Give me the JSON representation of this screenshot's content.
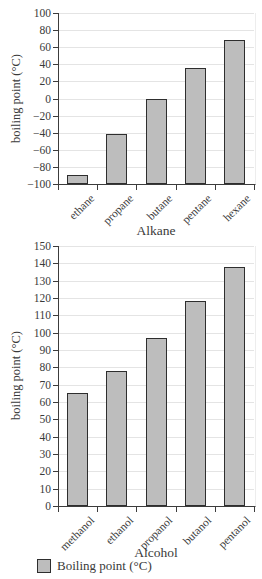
{
  "page": {
    "background": "#ffffff"
  },
  "colors": {
    "bar_fill": "#bdbdbd",
    "bar_border": "#2e2e2e",
    "gridline": "#e4e4e4",
    "axis": "#3c3c3c",
    "text": "#3a3a3a"
  },
  "legend": {
    "label": "Boiling point (°C)",
    "swatch_color": "#bdbdbd"
  },
  "chart_data": [
    {
      "type": "bar",
      "title": "",
      "xlabel": "Alkane",
      "ylabel": "boiling point (°C)",
      "categories": [
        "ethane",
        "propane",
        "butane",
        "pentane",
        "hexane"
      ],
      "values": [
        -89,
        -42,
        -1,
        36,
        69
      ],
      "ylim": [
        -100,
        100
      ],
      "ytick_step": 20,
      "grid": true,
      "legend_position": "none",
      "bar_baseline": "axis-minimum"
    },
    {
      "type": "bar",
      "title": "",
      "xlabel": "Alcohol",
      "ylabel": "boiling point (°C)",
      "categories": [
        "methanol",
        "ethanol",
        "propanol",
        "butanol",
        "pentanol"
      ],
      "values": [
        65,
        78,
        97,
        118,
        138
      ],
      "ylim": [
        0,
        150
      ],
      "ytick_step": 10,
      "grid": true,
      "legend_position": "bottom",
      "bar_baseline": "axis-minimum"
    }
  ]
}
